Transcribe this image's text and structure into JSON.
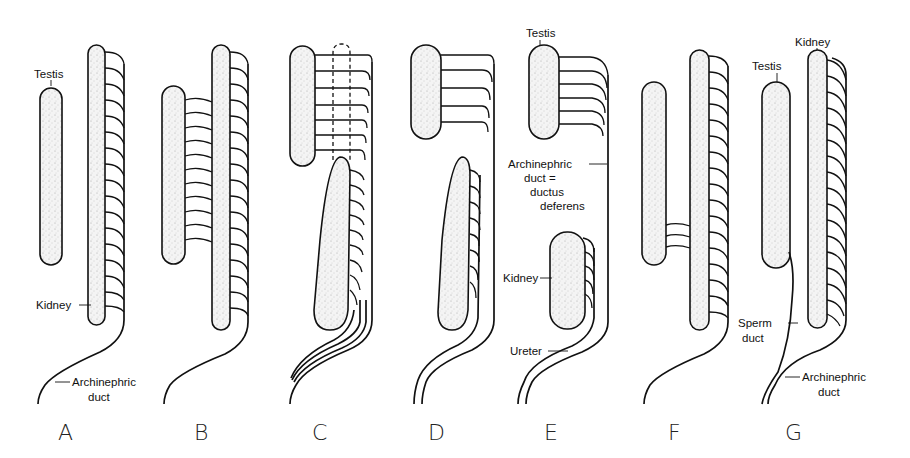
{
  "figure": {
    "panels": [
      "A",
      "B",
      "C",
      "D",
      "E",
      "F",
      "G"
    ],
    "labels": {
      "A": {
        "testis": "Testis",
        "kidney": "Kidney",
        "archinephric_duct_1": "Archinephric",
        "archinephric_duct_2": "duct"
      },
      "E": {
        "testis": "Testis",
        "archinephric_1": "Archinephric",
        "archinephric_2": "duct =",
        "archinephric_3": "ductus",
        "archinephric_4": "deferens",
        "kidney": "Kidney",
        "ureter": "Ureter"
      },
      "G": {
        "testis": "Testis",
        "kidney": "Kidney",
        "sperm_duct_1": "Sperm",
        "sperm_duct_2": "duct",
        "archinephric_duct_1": "Archinephric",
        "archinephric_duct_2": "duct"
      }
    }
  }
}
